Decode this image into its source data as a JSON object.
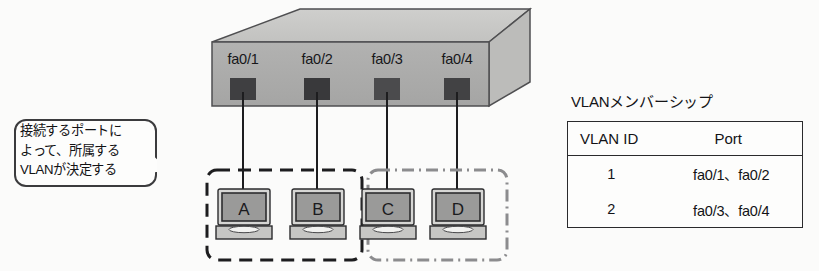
{
  "diagram": {
    "switch": {
      "name": "ethernet-switch",
      "ports": [
        {
          "label": "fa0/1"
        },
        {
          "label": "fa0/2"
        },
        {
          "label": "fa0/3"
        },
        {
          "label": "fa0/4"
        }
      ],
      "colors": {
        "front_face": "#adadad",
        "top_face": "#c9c9c7",
        "side_face": "#bdbdbb",
        "outline": "#4a4a4c",
        "port_dark": "#3b3b3d"
      }
    },
    "callout": {
      "name": "vlan-explanation-callout",
      "text": "接続するポートに\nよって、所属する\nVLANが決定する"
    },
    "computers": [
      {
        "label": "A",
        "group": "vlan1"
      },
      {
        "label": "B",
        "group": "vlan1"
      },
      {
        "label": "C",
        "group": "vlan2"
      },
      {
        "label": "D",
        "group": "vlan2"
      }
    ],
    "groups": [
      {
        "name": "vlan1-group",
        "style": "dashed",
        "color": "#1d1d1f"
      },
      {
        "name": "vlan2-group",
        "style": "dash-dot",
        "color": "#8c8c8e"
      }
    ],
    "vlan_table": {
      "title": "VLANメンバーシップ",
      "headers": [
        "VLAN ID",
        "Port"
      ],
      "rows": [
        {
          "vlan_id": "1",
          "ports": "fa0/1、fa0/2"
        },
        {
          "vlan_id": "2",
          "ports": "fa0/3、fa0/4"
        }
      ]
    }
  }
}
